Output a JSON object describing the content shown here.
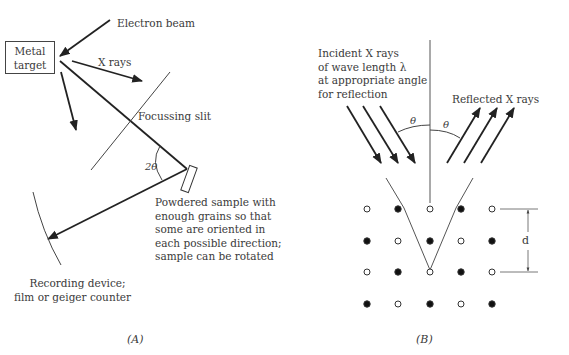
{
  "panel_a": {
    "target_label_line1": "Metal",
    "target_label_line2": "target",
    "electron_beam": "Electron beam",
    "x_rays": "X rays",
    "focussing_slit": "Focussing slit",
    "angle": "2θ",
    "sample_desc": [
      "Powdered sample with",
      "enough grains so that",
      "some are oriented in",
      "each possible direction;",
      "sample can be rotated"
    ],
    "recording_desc": [
      "Recording device;",
      "film or geiger counter"
    ],
    "caption": "(A)"
  },
  "panel_b": {
    "incident_desc": [
      "Incident X rays",
      "of wave length λ",
      "at appropriate angle",
      "for reflection"
    ],
    "reflected": "Reflected X rays",
    "theta_left": "θ",
    "theta_right": "θ",
    "spacing": "d",
    "caption": "(B)",
    "lattice": {
      "rows": [
        [
          "open",
          "filled",
          "open",
          "filled",
          "open"
        ],
        [
          "filled",
          "open",
          "filled",
          "open",
          "filled"
        ],
        [
          "open",
          "filled",
          "open",
          "filled",
          "open"
        ],
        [
          "filled",
          "open",
          "filled",
          "open",
          "filled"
        ]
      ]
    }
  },
  "colors": {
    "ink": "#222222",
    "text": "#3a3a3a"
  }
}
